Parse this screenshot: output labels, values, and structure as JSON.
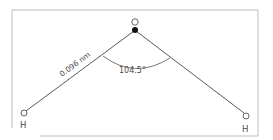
{
  "diagram": {
    "atoms": [
      {
        "id": "O",
        "label": "O",
        "role": "center"
      },
      {
        "id": "H1",
        "label": "H",
        "role": "left"
      },
      {
        "id": "H2",
        "label": "H",
        "role": "right"
      }
    ],
    "bond_length_label": "0.096 nm",
    "bond_angle_label": "104.5°",
    "bond_angle_degrees": 104.5,
    "colors": {
      "line": "#5a5a5a",
      "frame": "#b8b8b8",
      "text": "#4a4a4a",
      "lone_pair_dot": "#111111"
    }
  }
}
